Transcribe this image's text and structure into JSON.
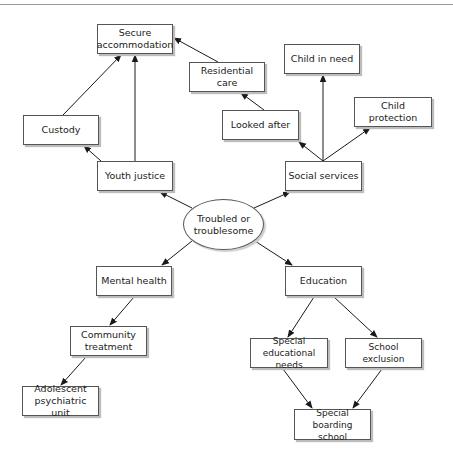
{
  "header": {
    "running_text": "· · · · · · · · · · · · · · · · · · ·"
  },
  "center": {
    "id": "troubled",
    "label": "Troubled or troublesome"
  },
  "nodes": [
    {
      "id": "secure",
      "label": "Secure accommodation"
    },
    {
      "id": "residential",
      "label": "Residential care"
    },
    {
      "id": "child_in_need",
      "label": "Child in need"
    },
    {
      "id": "looked_after",
      "label": "Looked after"
    },
    {
      "id": "child_protection",
      "label": "Child protection"
    },
    {
      "id": "custody",
      "label": "Custody"
    },
    {
      "id": "youth_justice",
      "label": "Youth justice"
    },
    {
      "id": "social_services",
      "label": "Social services"
    },
    {
      "id": "mental_health",
      "label": "Mental health"
    },
    {
      "id": "education",
      "label": "Education"
    },
    {
      "id": "community_treatment",
      "label": "Community treatment"
    },
    {
      "id": "adolescent_unit",
      "label": "Adolescent psychiatric unit"
    },
    {
      "id": "sen",
      "label": "Special educational needs"
    },
    {
      "id": "school_exclusion",
      "label": "School exclusion"
    },
    {
      "id": "boarding",
      "label": "Special boarding school"
    }
  ],
  "edges": [
    {
      "from": "troubled",
      "to": "youth_justice"
    },
    {
      "from": "troubled",
      "to": "social_services"
    },
    {
      "from": "troubled",
      "to": "mental_health"
    },
    {
      "from": "troubled",
      "to": "education"
    },
    {
      "from": "youth_justice",
      "to": "custody"
    },
    {
      "from": "youth_justice",
      "to": "secure"
    },
    {
      "from": "custody",
      "to": "secure"
    },
    {
      "from": "social_services",
      "to": "looked_after"
    },
    {
      "from": "social_services",
      "to": "child_in_need"
    },
    {
      "from": "social_services",
      "to": "child_protection"
    },
    {
      "from": "looked_after",
      "to": "residential"
    },
    {
      "from": "residential",
      "to": "secure"
    },
    {
      "from": "mental_health",
      "to": "community_treatment"
    },
    {
      "from": "community_treatment",
      "to": "adolescent_unit"
    },
    {
      "from": "education",
      "to": "sen"
    },
    {
      "from": "education",
      "to": "school_exclusion"
    },
    {
      "from": "sen",
      "to": "boarding"
    },
    {
      "from": "school_exclusion",
      "to": "boarding"
    }
  ],
  "colors": {
    "line": "#1a1a1a",
    "border": "#555555",
    "shadow": "#bdbdbd",
    "text": "#222222"
  }
}
